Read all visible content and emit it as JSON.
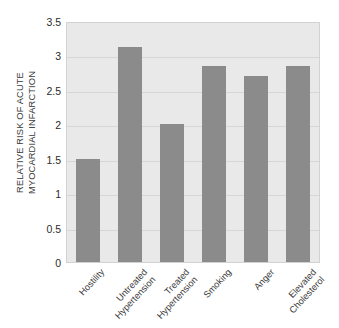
{
  "chart_data": {
    "type": "bar",
    "title": "",
    "subtitle": "",
    "xlabel": "",
    "ylabel": "RELATIVE RISK OF ACUTE MYOCARDIAL INFARCTION",
    "ylabel_lines": [
      "RELATIVE RISK OF ACUTE",
      "MYOCARDIAL INFARCTION"
    ],
    "categories": [
      "Hostility",
      "Untreated Hypertension",
      "Treated Hypertension",
      "Smoking",
      "Anger",
      "Elevated Cholesterol"
    ],
    "category_lines": [
      [
        "Hostility"
      ],
      [
        "Untreated",
        "Hypertension"
      ],
      [
        "Treated",
        "Hypertension"
      ],
      [
        "Smoking"
      ],
      [
        "Anger"
      ],
      [
        "Elevated",
        "Cholesterol"
      ]
    ],
    "values": [
      1.5,
      3.12,
      2.0,
      2.84,
      2.7,
      2.85
    ],
    "ylim": [
      0,
      3.5
    ],
    "yticks": [
      0,
      0.5,
      1,
      1.5,
      2,
      2.5,
      3,
      3.5
    ],
    "ytick_labels": [
      "0",
      "0.5",
      "1",
      "1.5",
      "2",
      "2.5",
      "3",
      "3.5"
    ],
    "grid": true,
    "legend": null,
    "legend_position": "none",
    "bar_color": "#8b8b8b",
    "plot_background": "#e9e9e9",
    "gridline_color": "#d6d6d6",
    "page_background": "#ffffff"
  }
}
